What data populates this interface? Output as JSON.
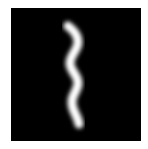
{
  "image": {
    "kind": "handwritten-digit",
    "digit_label": "1",
    "background_color": "#ffffff",
    "frame_color": "#000000",
    "stroke_color": "#ffffff",
    "stroke_points": [
      [
        68,
        26
      ],
      [
        73,
        32
      ],
      [
        78,
        42
      ],
      [
        74,
        52
      ],
      [
        70,
        62
      ],
      [
        73,
        72
      ],
      [
        78,
        82
      ],
      [
        74,
        92
      ],
      [
        72,
        102
      ],
      [
        76,
        114
      ],
      [
        79,
        124
      ]
    ]
  }
}
